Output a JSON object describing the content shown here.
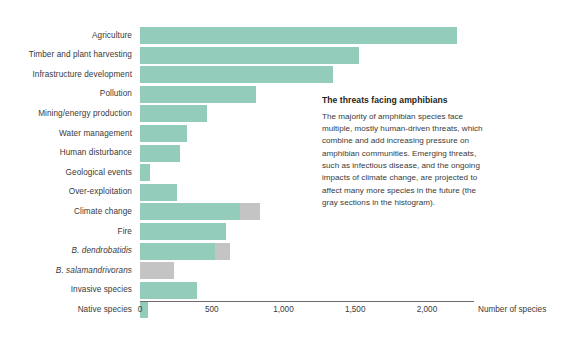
{
  "chart_data": {
    "type": "bar",
    "orientation": "horizontal",
    "stacked": true,
    "title": "",
    "xlabel": "Number of species",
    "ylabel": "",
    "xlim": [
      0,
      2300
    ],
    "xticks": [
      0,
      500,
      1000,
      1500,
      2000
    ],
    "xticklabels": [
      "0",
      "500",
      "1,000",
      "1,500",
      "2,000"
    ],
    "grid": false,
    "legend": "none",
    "colors": {
      "established_threat": "#93ccba",
      "emerging_threat": "#c4c4c4",
      "axis": "#6d6a68",
      "text": "#39393a",
      "background": "#ffffff"
    },
    "categories": [
      "Agriculture",
      "Timber and plant harvesting",
      "Infrastructure development",
      "Pollution",
      "Mining/energy production",
      "Water management",
      "Human disturbance",
      "Geological events",
      "Over-exploitation",
      "Climate change",
      "Fire",
      "B. dendrobatidis",
      "B. salamandrivorans",
      "Invasive species",
      "Native species"
    ],
    "category_italic": [
      false,
      false,
      false,
      false,
      false,
      false,
      false,
      false,
      false,
      false,
      false,
      true,
      true,
      false,
      false
    ],
    "series": [
      {
        "name": "Current threats",
        "color": "#93ccba",
        "values": [
          2210,
          1525,
          1345,
          810,
          470,
          325,
          280,
          70,
          260,
          695,
          600,
          525,
          0,
          400,
          55
        ]
      },
      {
        "name": "Projected future threats",
        "color": "#c4c4c4",
        "values": [
          0,
          0,
          0,
          0,
          0,
          0,
          0,
          0,
          0,
          140,
          0,
          100,
          240,
          0,
          0
        ]
      }
    ],
    "annotation": {
      "title": "The threats facing amphibians",
      "body": "The majority of amphibian species face multiple, mostly human-driven threats, which combine and add increasing pressure on amphibian communities. Emerging threats, such as infectious disease, and the ongoing impacts of climate change, are projected to affect many more species in the future (the gray sections in the histogram)."
    }
  }
}
